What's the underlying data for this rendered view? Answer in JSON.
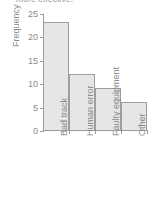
{
  "caption": {
    "text": "more effective."
  },
  "chart_data": {
    "type": "bar",
    "title": "",
    "subtitle": "",
    "xlabel": "",
    "ylabel": "Frequency",
    "categories": [
      "Bad track",
      "Human error",
      "Faulty equipment",
      "Other"
    ],
    "values": [
      23,
      12,
      9,
      6
    ],
    "series": [
      {
        "name": "Frequency",
        "values": [
          23,
          12,
          9,
          6
        ]
      }
    ],
    "ylim": [
      0,
      25
    ],
    "ytick_labels": [
      "0",
      "5",
      "10",
      "15",
      "20",
      "25"
    ],
    "ytick_values": [
      0,
      5,
      10,
      15,
      20,
      25
    ],
    "ytick_step": 5,
    "grid": false,
    "legend": false,
    "legend_position": "none",
    "orientation": "vertical",
    "xtick_rotation": -90,
    "colors": {
      "bar_fill": "#e6e6e6",
      "bar_stroke": "#9e9e9e",
      "axis": "#9b9b9b",
      "text": "#8a8a8a",
      "background": "#ffffff"
    }
  }
}
